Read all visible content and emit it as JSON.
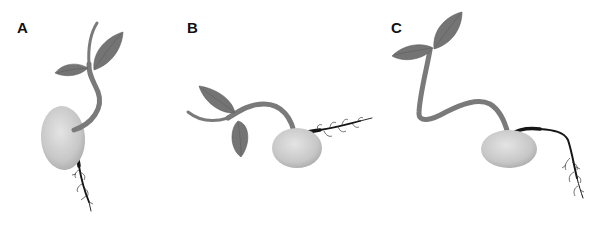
{
  "figure": {
    "panels": [
      {
        "id": "A",
        "label": "A",
        "orientation": "upright seedling; seed on left, shoot curving upward, root growing downward"
      },
      {
        "id": "B",
        "label": "B",
        "orientation": "shoot bent sideways to the left, root growing to the right"
      },
      {
        "id": "C",
        "label": "C",
        "orientation": "shoot looping up and left, root running right then turning downward"
      }
    ]
  },
  "colors": {
    "background": "#ffffff",
    "stem": "#7a7a7a",
    "leaf": "#747474",
    "seed_light": "#e4e4e4",
    "seed_dark": "#a9a9a9",
    "root": "#151515",
    "label": "#111111"
  }
}
